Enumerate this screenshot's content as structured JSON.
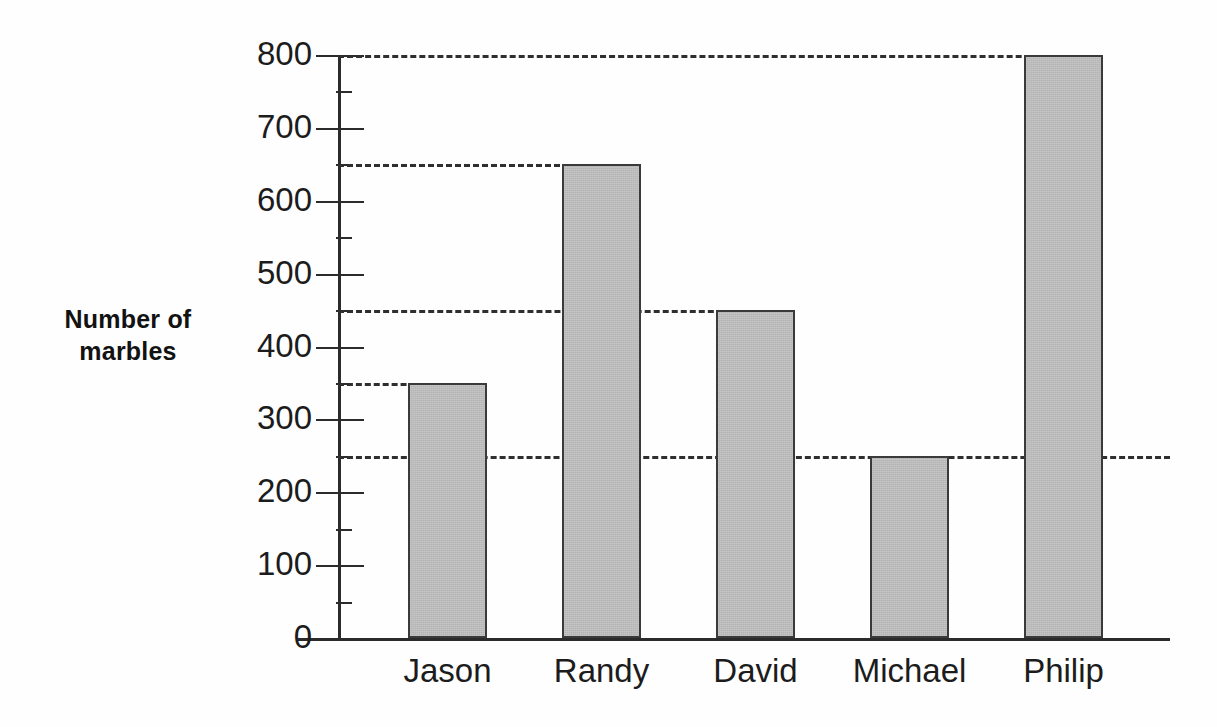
{
  "chart_data": {
    "type": "bar",
    "title": "",
    "xlabel": "",
    "ylabel": "Number of\nmarbles",
    "categories": [
      "Jason",
      "Randy",
      "David",
      "Michael",
      "Philip"
    ],
    "values": [
      350,
      650,
      450,
      250,
      800
    ],
    "ylim": [
      0,
      800
    ],
    "y_major_ticks": [
      0,
      100,
      200,
      300,
      400,
      500,
      600,
      700,
      800
    ],
    "y_major_tick_labels": [
      "0",
      "100",
      "200",
      "300",
      "400",
      "500",
      "600",
      "700",
      "800"
    ],
    "y_minor_ticks": [
      50,
      150,
      250,
      350,
      450,
      550,
      650,
      750
    ],
    "y_tick_interval": 100,
    "y_minor_tick_interval": 50,
    "gridlines": [
      {
        "value": 800,
        "style": "dashed",
        "extends_to": "philip-bar"
      },
      {
        "value": 650,
        "style": "dashed",
        "extends_to": "randy-bar"
      },
      {
        "value": 450,
        "style": "dashed",
        "extends_to": "david-bar"
      },
      {
        "value": 350,
        "style": "dashed",
        "extends_to": "jason-bar"
      },
      {
        "value": 250,
        "style": "dashed",
        "extends_to": "plot-right-edge"
      }
    ],
    "grid": true,
    "legend": null,
    "legend_position": "none",
    "bar_fill_color": "#b4b4b4",
    "bar_border_color": "#3a3a3a",
    "axis_color": "#2b2b2b",
    "background_color": "#fefefe",
    "annotations": []
  },
  "axis": {
    "y_title_line1": "Number of",
    "y_title_line2": "marbles",
    "y_title": "Number of\nmarbles"
  }
}
